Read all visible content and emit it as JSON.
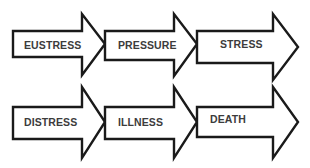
{
  "diagram": {
    "type": "chevron-arrow-flow",
    "colors": {
      "stroke": "#1a1a1a",
      "fill": "#ffffff",
      "text": "#3c3c3c"
    },
    "rows": [
      {
        "steps": [
          {
            "label": "EUSTRESS"
          },
          {
            "label": "PRESSURE"
          },
          {
            "label": "STRESS"
          }
        ]
      },
      {
        "steps": [
          {
            "label": "DISTRESS"
          },
          {
            "label": "ILLNESS"
          },
          {
            "label": "DEATH"
          }
        ]
      }
    ]
  }
}
